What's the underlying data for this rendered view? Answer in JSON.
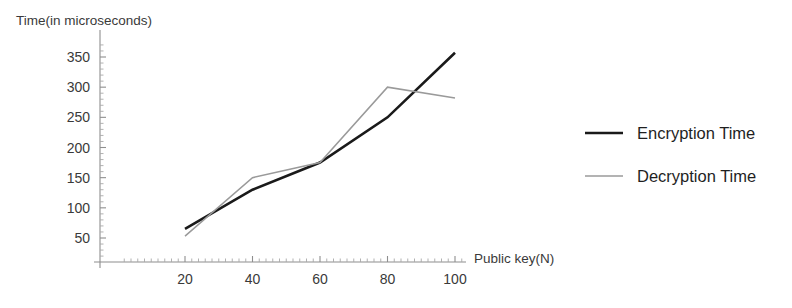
{
  "chart_data": {
    "type": "line",
    "title": "",
    "xlabel": "Public key(N)",
    "ylabel": "Time(in microseconds)",
    "x": [
      20,
      40,
      60,
      80,
      100
    ],
    "xlim": [
      0,
      108
    ],
    "ylim": [
      0,
      372
    ],
    "xticks": [
      20,
      40,
      60,
      80,
      100
    ],
    "yticks": [
      50,
      100,
      150,
      200,
      250,
      300,
      350
    ],
    "xtick_labels": [
      "20",
      "40",
      "60",
      "80",
      "100"
    ],
    "ytick_labels": [
      "50",
      "100",
      "150",
      "200",
      "250",
      "300",
      "350"
    ],
    "grid": false,
    "minor_ticks": true,
    "legend_position": "right",
    "series": [
      {
        "name": "Encryption Time",
        "color": "#1a1a1a",
        "line_width": 2.6,
        "values": [
          65,
          130,
          175,
          250,
          357
        ]
      },
      {
        "name": "Decryption Time",
        "color": "#9a9a9a",
        "line_width": 1.5,
        "values": [
          53,
          150,
          175,
          300,
          282
        ]
      }
    ]
  },
  "axes": {
    "y_axis_title": "Time(in microseconds)",
    "x_axis_title": "Public key(N)"
  },
  "legend": {
    "entries": [
      {
        "label": "Encryption Time",
        "color": "#1a1a1a",
        "line_width": 2.6
      },
      {
        "label": "Decryption Time",
        "color": "#9a9a9a",
        "line_width": 1.5
      }
    ]
  }
}
